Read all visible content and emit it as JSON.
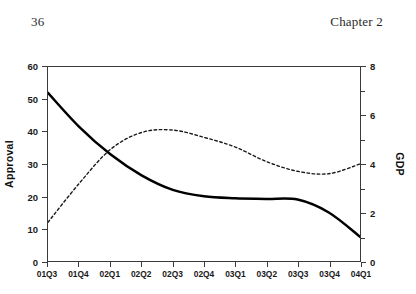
{
  "header": {
    "folio": "36",
    "chapter": "Chapter 2"
  },
  "chart_data": {
    "type": "line",
    "title": "",
    "xlabel": "",
    "ylabel": "Approval",
    "y2label": "GDP",
    "categories": [
      "01Q3",
      "01Q4",
      "02Q1",
      "02Q2",
      "02Q3",
      "02Q4",
      "03Q1",
      "03Q2",
      "03Q3",
      "03Q4",
      "04Q1"
    ],
    "ylim": [
      0,
      60
    ],
    "yticks": [
      0,
      10,
      20,
      30,
      40,
      50,
      60
    ],
    "ytick_labels": [
      "0",
      "10",
      "20",
      "30",
      "40",
      "50",
      "60"
    ],
    "y2lim": [
      0,
      8
    ],
    "y2ticks": [
      0,
      1,
      2,
      3,
      4,
      5,
      6,
      7,
      8
    ],
    "y2tick_labels": [
      "0",
      "",
      "2",
      "",
      "4",
      "",
      "6",
      "",
      "8"
    ],
    "grid": false,
    "legend": "none",
    "series": [
      {
        "name": "Approval",
        "axis": "left",
        "style": "solid",
        "color": "#000000",
        "values": [
          52.0,
          41.5,
          33.0,
          26.5,
          22.0,
          20.0,
          19.4,
          19.2,
          19.0,
          15.0,
          7.5
        ]
      },
      {
        "name": "GDP",
        "axis": "right",
        "style": "dashed",
        "color": "#1a1a1a",
        "values": [
          1.6,
          3.2,
          4.6,
          5.3,
          5.4,
          5.1,
          4.7,
          4.1,
          3.7,
          3.6,
          4.0
        ]
      }
    ]
  }
}
